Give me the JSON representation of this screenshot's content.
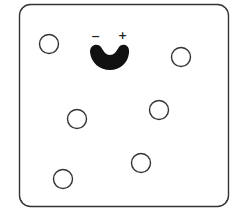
{
  "diagram": {
    "container": {
      "x": 19.5,
      "y": 4.5,
      "width": 209,
      "height": 202,
      "radius": 11,
      "stroke": "#333333",
      "stroke_width": 1.4
    },
    "receptor": {
      "fill": "#111111",
      "labels": {
        "negative": "−",
        "positive": "+"
      }
    },
    "particles": [
      {
        "cx": 49,
        "cy": 44,
        "r": 9.5
      },
      {
        "cx": 181,
        "cy": 57,
        "r": 9.5
      },
      {
        "cx": 77,
        "cy": 119,
        "r": 9.5
      },
      {
        "cx": 159,
        "cy": 110,
        "r": 9.5
      },
      {
        "cx": 141,
        "cy": 163,
        "r": 9.5
      },
      {
        "cx": 63,
        "cy": 179,
        "r": 9.5
      }
    ],
    "particle_stroke": "#333333"
  }
}
